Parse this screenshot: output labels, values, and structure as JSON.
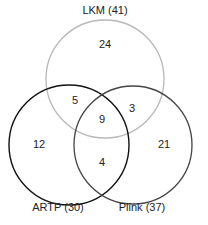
{
  "diagram": {
    "type": "venn3",
    "sets": [
      {
        "id": "lkm",
        "label": "LKM (41)",
        "name": "LKM",
        "total": 41,
        "stroke": "#b8b8b8"
      },
      {
        "id": "artp",
        "label": "ARTP (30)",
        "name": "ARTP",
        "total": 30,
        "stroke": "#111111"
      },
      {
        "id": "plink",
        "label": "Plink (37)",
        "name": "Plink",
        "total": 37,
        "stroke": "#444444"
      }
    ],
    "regions": {
      "lkm_only": "24",
      "artp_only": "12",
      "plink_only": "21",
      "lkm_artp": "5",
      "lkm_plink": "3",
      "artp_plink": "4",
      "all_three": "9"
    }
  }
}
